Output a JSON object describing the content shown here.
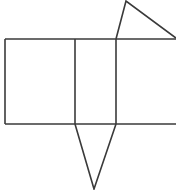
{
  "figure": {
    "title": "Geometric net figure",
    "background_color": "#ffffff",
    "stroke_color": "#3a3a3a",
    "stroke_width": 1.6,
    "canvas": {
      "width": 176,
      "height": 190
    },
    "shapes": [
      {
        "id": "rect-top-edge",
        "name": "rectangle-top-edge",
        "kind": "polyline",
        "points": "5,39 176,39"
      },
      {
        "id": "rect-bottom-edge",
        "name": "rectangle-bottom-edge",
        "kind": "polyline",
        "points": "5,124 176,124"
      },
      {
        "id": "rect-left-edge",
        "name": "rectangle-left-edge",
        "kind": "polyline",
        "points": "5,39 5,124"
      },
      {
        "id": "divider-left",
        "name": "rectangle-divider-left",
        "kind": "polyline",
        "points": "75,39 75,124"
      },
      {
        "id": "divider-right",
        "name": "rectangle-divider-right",
        "kind": "polyline",
        "points": "116,39 116,124"
      },
      {
        "id": "triangle-top",
        "name": "top-triangle",
        "kind": "polyline",
        "points": "116,39 126,1 176,38"
      },
      {
        "id": "triangle-bottom",
        "name": "bottom-inverted-triangle",
        "kind": "polyline",
        "points": "75,124 94,189 116,124"
      }
    ]
  }
}
